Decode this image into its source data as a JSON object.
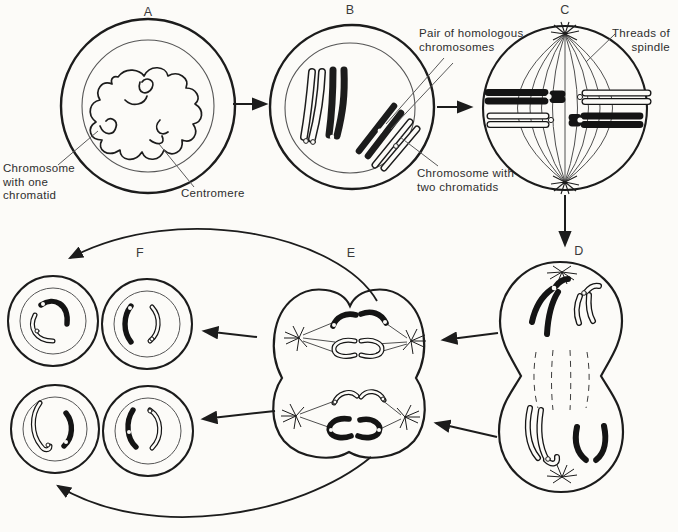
{
  "diagram": {
    "type": "biology-meiosis-stages",
    "stages": {
      "a": "A",
      "b": "B",
      "c": "C",
      "d": "D",
      "e": "E",
      "f": "F"
    },
    "labels": {
      "chromosome_one_chromatid": {
        "line1": "Chromosome",
        "line2": "with one",
        "line3": "chromatid"
      },
      "centromere": "Centromere",
      "homologous_pair": {
        "line1": "Pair of homologous",
        "line2": "chromosomes"
      },
      "chromosome_two_chromatids": {
        "line1": "Chromosome with",
        "line2": "two chromatids"
      },
      "threads_of_spindle": {
        "line1": "Threads of",
        "line2": "spindle"
      }
    },
    "colors": {
      "ink": "#1c1c1c",
      "paper": "#fcfbf8",
      "membrane_thin": "#555555"
    }
  }
}
